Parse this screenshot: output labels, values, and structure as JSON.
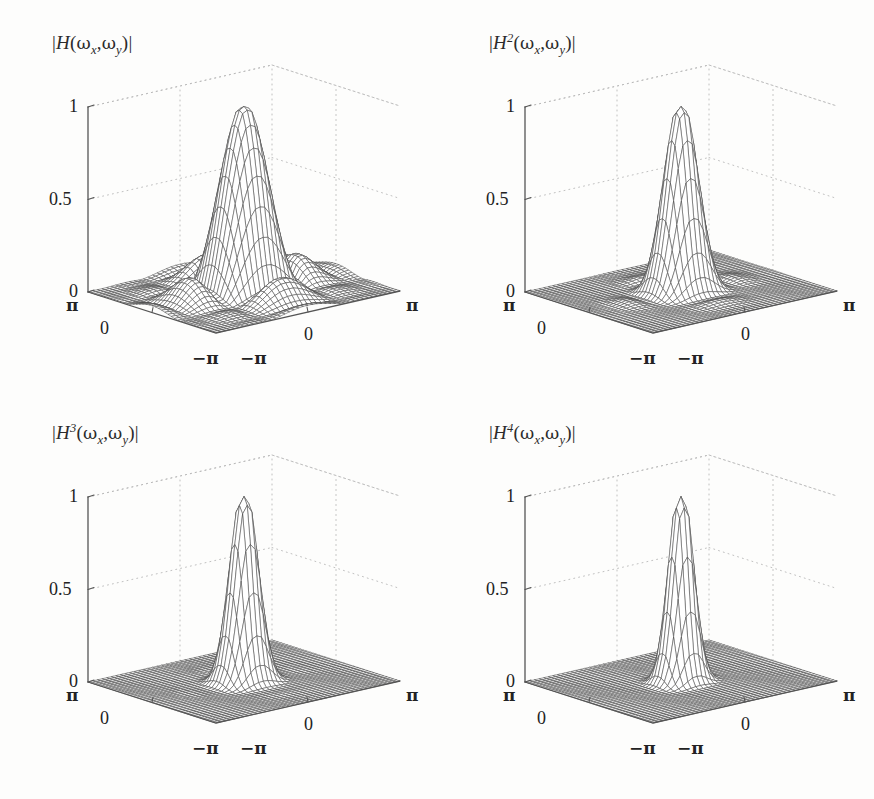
{
  "figure": {
    "background_color": "#fdfdfc",
    "ink_color": "#2b2b2b",
    "grid_color": "#b9b9b9",
    "mesh_color": "#4a4a4a",
    "axis_color": "#555555",
    "rows": 2,
    "cols": 2
  },
  "chart_data": [
    {
      "type": "surface",
      "id": "panel-1",
      "title": "|H(ωx,ωy)|",
      "title_base": "H",
      "title_power": "",
      "power": 1,
      "xlabel": "ωx",
      "ylabel": "ωy",
      "zlabel": "",
      "xlim": [
        -3.141592653589793,
        3.141592653589793
      ],
      "ylim": [
        -3.141592653589793,
        3.141592653589793
      ],
      "zlim": [
        0,
        1
      ],
      "xticks": [
        -3.141592653589793,
        0,
        3.141592653589793
      ],
      "xticklabels": [
        "−π",
        "0",
        "π"
      ],
      "yticks": [
        -3.141592653589793,
        0,
        3.141592653589793
      ],
      "yticklabels": [
        "−π",
        "0",
        "π"
      ],
      "zticks": [
        0,
        0.5,
        1
      ],
      "zticklabels": [
        "0",
        "0.5",
        "1"
      ],
      "grid": true,
      "legend": "none",
      "mesh_n": 41,
      "formula": "separable-sinc-magnitude",
      "peak_value": 1.0,
      "sidelobe_peak_value": 0.47,
      "description": "Magnitude frequency response with central main lobe and four symmetric side lobes"
    },
    {
      "type": "surface",
      "id": "panel-2",
      "title": "|H²(ωx,ωy)|",
      "title_base": "H",
      "title_power": "2",
      "power": 2,
      "xlabel": "ωx",
      "ylabel": "ωy",
      "zlabel": "",
      "xlim": [
        -3.141592653589793,
        3.141592653589793
      ],
      "ylim": [
        -3.141592653589793,
        3.141592653589793
      ],
      "zlim": [
        0,
        1
      ],
      "xticks": [
        -3.141592653589793,
        0,
        3.141592653589793
      ],
      "xticklabels": [
        "−π",
        "0",
        "π"
      ],
      "yticks": [
        -3.141592653589793,
        0,
        3.141592653589793
      ],
      "yticklabels": [
        "−π",
        "0",
        "π"
      ],
      "zticks": [
        0,
        0.5,
        1
      ],
      "zticklabels": [
        "0",
        "0.5",
        "1"
      ],
      "grid": true,
      "legend": "none",
      "mesh_n": 41,
      "formula": "separable-sinc-magnitude",
      "peak_value": 1.0,
      "sidelobe_peak_value": 0.22,
      "description": "Squared response: narrower main lobe, strongly attenuated side lobes"
    },
    {
      "type": "surface",
      "id": "panel-3",
      "title": "|H³(ωx,ωy)|",
      "title_base": "H",
      "title_power": "3",
      "power": 3,
      "xlabel": "ωx",
      "ylabel": "ωy",
      "zlabel": "",
      "xlim": [
        -3.141592653589793,
        3.141592653589793
      ],
      "ylim": [
        -3.141592653589793,
        3.141592653589793
      ],
      "zlim": [
        0,
        1
      ],
      "xticks": [
        -3.141592653589793,
        0,
        3.141592653589793
      ],
      "xticklabels": [
        "−π",
        "0",
        "π"
      ],
      "yticks": [
        -3.141592653589793,
        0,
        3.141592653589793
      ],
      "yticklabels": [
        "−π",
        "0",
        "π"
      ],
      "zticks": [
        0,
        0.5,
        1
      ],
      "zticklabels": [
        "0",
        "0.5",
        "1"
      ],
      "grid": true,
      "legend": "none",
      "mesh_n": 41,
      "formula": "separable-sinc-magnitude",
      "peak_value": 1.0,
      "sidelobe_peak_value": 0.1,
      "description": "Cubed response: sharp main lobe over an almost flat floor"
    },
    {
      "type": "surface",
      "id": "panel-4",
      "title": "|H⁴(ωx,ωy)|",
      "title_base": "H",
      "title_power": "4",
      "power": 4,
      "xlabel": "ωx",
      "ylabel": "ωy",
      "zlabel": "",
      "xlim": [
        -3.141592653589793,
        3.141592653589793
      ],
      "ylim": [
        -3.141592653589793,
        3.141592653589793
      ],
      "zlim": [
        0,
        1
      ],
      "xticks": [
        -3.141592653589793,
        0,
        3.141592653589793
      ],
      "xticklabels": [
        "−π",
        "0",
        "π"
      ],
      "yticks": [
        -3.141592653589793,
        0,
        3.141592653589793
      ],
      "yticklabels": [
        "−π",
        "0",
        "π"
      ],
      "zticks": [
        0,
        0.5,
        1
      ],
      "zticklabels": [
        "0",
        "0.5",
        "1"
      ],
      "grid": true,
      "legend": "none",
      "mesh_n": 41,
      "formula": "separable-sinc-magnitude",
      "peak_value": 1.0,
      "sidelobe_peak_value": 0.05,
      "description": "Fourth power: narrowest main lobe, essentially flat side lobe floor"
    }
  ]
}
